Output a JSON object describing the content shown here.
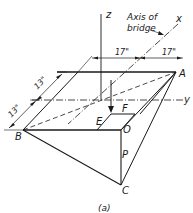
{
  "figure": {
    "caption": "(a)",
    "axes": {
      "z": "z",
      "x": "x",
      "y": "y"
    },
    "annotation": {
      "line1": "Axis of",
      "line2": "bridge"
    },
    "dimensions": {
      "top_left": "17\"",
      "top_right": "17\"",
      "side_upper": "13\"",
      "side_lower": "13\""
    },
    "points": {
      "A": "A",
      "B": "B",
      "C": "C",
      "O": "O",
      "E": "E",
      "F": "F",
      "P": "P"
    }
  }
}
